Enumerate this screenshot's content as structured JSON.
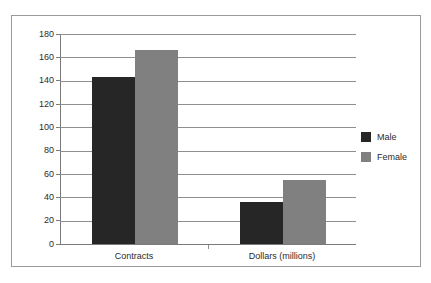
{
  "chart_data": {
    "type": "bar",
    "title": "",
    "subtitle": "",
    "xlabel": "",
    "ylabel": "",
    "categories": [
      "Contracts",
      "Dollars (millions)"
    ],
    "series": [
      {
        "name": "Male",
        "values": [
          143,
          36
        ],
        "color": "#262626"
      },
      {
        "name": "Female",
        "values": [
          166,
          55
        ],
        "color": "#808080"
      }
    ],
    "ylim": [
      0,
      180
    ],
    "ytick_step": 20,
    "yticks": [
      180,
      160,
      140,
      120,
      100,
      80,
      60,
      40,
      20,
      0
    ],
    "ytick_labels": [
      "180",
      "160",
      "140",
      "120",
      "100",
      "80",
      "60",
      "40",
      "20",
      "0"
    ],
    "grid": "horizontal",
    "legend_position": "right",
    "legend_entries": [
      "Male",
      "Female"
    ],
    "frame": "outer-box"
  },
  "legend": {
    "items": [
      {
        "label": "Male",
        "swatch": "male-color-swatch"
      },
      {
        "label": "Female",
        "swatch": "female-color-swatch"
      }
    ]
  },
  "colors": {
    "male": "#262626",
    "female": "#808080",
    "gridline": "#8f8f8f",
    "axis": "#7a7a7a",
    "frame": "#9a9a9a",
    "text": "#2b2b2b",
    "background": "#ffffff"
  }
}
